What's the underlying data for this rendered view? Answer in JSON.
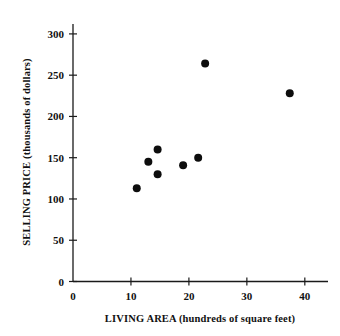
{
  "chart_data": {
    "type": "scatter",
    "title": "",
    "xlabel": "LIVING AREA (hundreds of square feet)",
    "ylabel": "SELLING PRICE (thousands of dollars)",
    "xlim": [
      0,
      44
    ],
    "ylim": [
      0,
      312
    ],
    "xticks": [
      0,
      10,
      20,
      30,
      40
    ],
    "yticks": [
      0,
      50,
      100,
      150,
      200,
      250,
      300
    ],
    "xtick_labels": [
      "0",
      "10",
      "20",
      "30",
      "40"
    ],
    "ytick_labels": [
      "0",
      "50",
      "100",
      "150",
      "200",
      "250",
      "300"
    ],
    "grid": false,
    "legend": null,
    "series": [
      {
        "name": "Houses",
        "points": [
          {
            "x": 11.0,
            "y": 113
          },
          {
            "x": 13.0,
            "y": 145
          },
          {
            "x": 14.6,
            "y": 160
          },
          {
            "x": 14.6,
            "y": 130
          },
          {
            "x": 19.0,
            "y": 141
          },
          {
            "x": 21.6,
            "y": 150
          },
          {
            "x": 22.8,
            "y": 264
          },
          {
            "x": 37.4,
            "y": 228
          }
        ]
      }
    ]
  },
  "figure": {
    "marker_color": "#0d0d0d",
    "axis_color": "#1a1a1a",
    "background": "#ffffff",
    "marker_radius": 4.0
  }
}
